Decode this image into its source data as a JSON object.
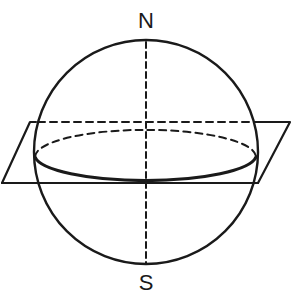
{
  "diagram": {
    "type": "sphere-with-equatorial-plane",
    "labels": {
      "north": "N",
      "south": "S"
    },
    "colors": {
      "stroke": "#1a1a1a",
      "background": "#ffffff"
    },
    "elements": [
      "sphere-outline",
      "polar-axis-dashed",
      "equatorial-plane",
      "equator-ellipse-back-dashed",
      "equator-ellipse-front-solid",
      "horizontal-dashed-line"
    ]
  }
}
